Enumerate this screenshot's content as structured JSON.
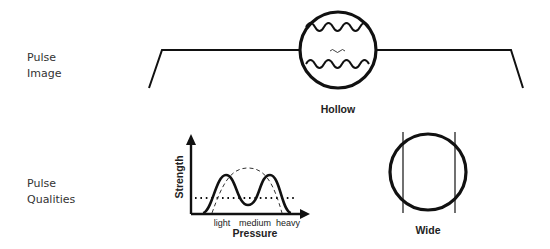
{
  "rows": [
    {
      "label_line1": "Pulse",
      "label_line2": "Image"
    },
    {
      "label_line1": "Pulse",
      "label_line2": "Qualities"
    }
  ],
  "pulse_image": {
    "caption": "Hollow",
    "icon": "hollow-pulse-circle"
  },
  "pulse_qualities": {
    "strength_chart": {
      "ylabel": "Strength",
      "xlabel": "Pressure",
      "ticks": [
        "light",
        "medium",
        "heavy"
      ]
    },
    "width_figure": {
      "caption": "Wide",
      "icon": "wide-pulse-circle"
    }
  },
  "colors": {
    "stroke": "#111111",
    "text": "#333333",
    "background": "#ffffff"
  }
}
